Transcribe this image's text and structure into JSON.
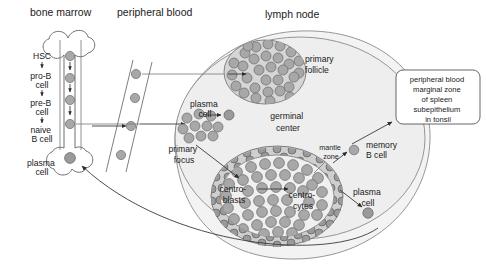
{
  "headers": [
    {
      "id": "bone-marrow",
      "label": "bone marrow",
      "x": 30,
      "y": 16
    },
    {
      "id": "peripheral-blood",
      "label": "peripheral blood",
      "x": 117,
      "y": 16
    },
    {
      "id": "lymph-node",
      "label": "lymph node",
      "x": 265,
      "y": 18
    }
  ],
  "bone_marrow": {
    "stages": [
      {
        "id": "hsc",
        "lines": [
          "HSC"
        ],
        "x": 42,
        "y": 59
      },
      {
        "id": "pro-b-cell",
        "lines": [
          "pro-B",
          "cell"
        ],
        "x": 42,
        "y": 79
      },
      {
        "id": "pre-b-cell",
        "lines": [
          "pre-B",
          "cell"
        ],
        "x": 42,
        "y": 106
      },
      {
        "id": "naive-b-cell",
        "lines": [
          "naive",
          "B cell"
        ],
        "x": 42,
        "y": 133
      },
      {
        "id": "plasma-cell",
        "lines": [
          "plasma",
          "cell"
        ],
        "x": 42,
        "y": 166
      }
    ],
    "cells": [
      {
        "id": "hsc-cell",
        "cx": 70,
        "cy": 56,
        "r": 4.6
      },
      {
        "id": "pro-b-cell-dot",
        "cx": 70,
        "cy": 78,
        "r": 4.6
      },
      {
        "id": "pre-b-cell-dot",
        "cx": 70,
        "cy": 100,
        "r": 4.6
      },
      {
        "id": "naive-b-cell-dot",
        "cx": 70,
        "cy": 124,
        "r": 4.6
      },
      {
        "id": "marrow-plasma-cell-dot",
        "cx": 70,
        "cy": 158,
        "r": 5.4
      }
    ]
  },
  "peripheral_blood": {
    "cells": [
      {
        "id": "pb-cell-1",
        "cx": 136,
        "cy": 74,
        "r": 4.6
      },
      {
        "id": "pb-cell-2",
        "cx": 135,
        "cy": 98,
        "r": 4.6
      },
      {
        "id": "pb-cell-3",
        "cx": 131,
        "cy": 126,
        "r": 4.6
      },
      {
        "id": "pb-cell-4",
        "cx": 121,
        "cy": 155,
        "r": 4.6
      }
    ]
  },
  "lymph_node": {
    "primary_follicle": {
      "id": "primary-follicle",
      "label_lines": [
        "primary",
        "follicle"
      ],
      "label_x": 305,
      "label_y": 62,
      "cx": 265,
      "cy": 72,
      "rx": 41,
      "ry": 32
    },
    "primary_focus": {
      "id": "primary-focus",
      "label_lines": [
        "primary",
        "focus"
      ],
      "label_x": 184,
      "label_y": 152
    },
    "plasma_cell_upper": {
      "id": "plasma-cell-upper",
      "label_lines": [
        "plasma",
        "cell"
      ],
      "label_x": 205,
      "label_y": 107,
      "cell": {
        "cx": 229,
        "cy": 115,
        "r": 5.0
      }
    },
    "germinal_center": {
      "id": "germinal-center",
      "label_lines": [
        "germinal",
        "center"
      ],
      "label_x": 288,
      "label_y": 119
    },
    "mantle_zone": {
      "id": "mantle-zone",
      "label_lines": [
        "mantle",
        "zone"
      ],
      "label_x": 331,
      "label_y": 150
    },
    "centroblasts": {
      "id": "centroblasts",
      "label_lines": [
        "centro-",
        "blasts"
      ],
      "label_x": 234,
      "label_y": 192
    },
    "centrocytes": {
      "id": "centrocytes",
      "label_lines": [
        "centro-",
        "cytes"
      ],
      "label_x": 303,
      "label_y": 198
    },
    "memory_b_cell": {
      "id": "memory-b-cell",
      "label_lines": [
        "memory",
        "B cell"
      ],
      "label_x": 366,
      "label_y": 152,
      "cell": {
        "cx": 354,
        "cy": 150,
        "r": 4.8
      }
    },
    "plasma_cell_lower": {
      "id": "plasma-cell-lower",
      "label_lines": [
        "plasma",
        "cell"
      ],
      "label_x": 368,
      "label_y": 195,
      "cell": {
        "cx": 368,
        "cy": 213,
        "r": 5.2
      }
    }
  },
  "callout_box": {
    "id": "destination-box",
    "lines": [
      "peripheral blood",
      "marginal zone",
      "of spleen",
      "subepithelium",
      "in tonsil"
    ],
    "x": 396,
    "y": 70,
    "width": 84,
    "height": 54
  },
  "colors": {
    "cell_fill": "#a8a8a8",
    "cell_stroke": "#6a6a6a",
    "organ_fill": "#eeeeee",
    "follicle_fill": "#d6d6d6",
    "text": "#1a1a1a",
    "line": "#777777"
  }
}
